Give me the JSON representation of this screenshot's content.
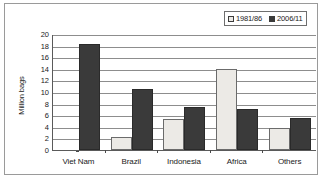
{
  "chart_data": {
    "type": "bar",
    "title": "",
    "xlabel": "",
    "ylabel": "Million bags",
    "ylim": [
      0,
      20
    ],
    "ytick_step": 2,
    "yticks": [
      "20",
      "18",
      "16",
      "14",
      "12",
      "10",
      "8",
      "6",
      "4",
      "2",
      "0"
    ],
    "grid": true,
    "legend_position": "top-right",
    "categories": [
      "Viet Nam",
      "Brazil",
      "Indonesia",
      "Africa",
      "Others"
    ],
    "series": [
      {
        "name": "1981/86",
        "color": "#eceae6",
        "values": [
          0,
          2.2,
          5.4,
          13.9,
          3.8
        ]
      },
      {
        "name": "2006/11",
        "color": "#3a3a3a",
        "values": [
          18.3,
          10.6,
          7.4,
          7.1,
          5.5
        ]
      }
    ]
  },
  "legend": {
    "entries": [
      {
        "label": "1981/86",
        "swatch": "light-square-swatch"
      },
      {
        "label": "2006/11",
        "swatch": "dark-square-swatch"
      }
    ]
  },
  "axis": {
    "y_title": "Million bags"
  }
}
